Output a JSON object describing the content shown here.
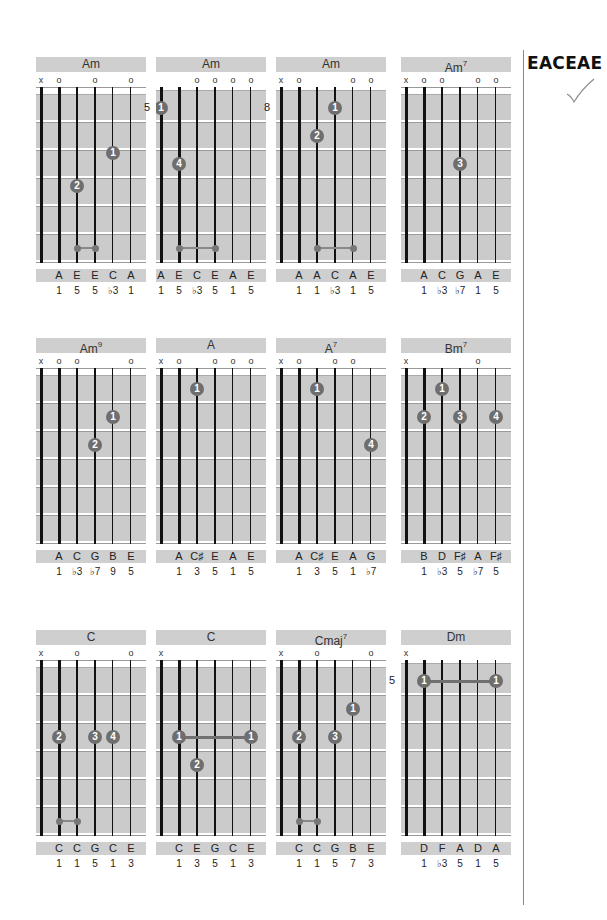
{
  "tuning": {
    "label": "EACEAE",
    "status_icon": "checkmark-icon"
  },
  "chords": [
    {
      "name": "Am",
      "sup": "",
      "marks": [
        "x",
        "o",
        "",
        "o",
        "",
        "o"
      ],
      "start_fret": "",
      "nut": true,
      "dots": [
        {
          "s": 4,
          "f": 2.1,
          "label": "1"
        },
        {
          "s": 2,
          "f": 3.3,
          "label": "2"
        }
      ],
      "barres": [],
      "small_barres": [
        {
          "from": 2,
          "to": 3,
          "f": 5.5
        }
      ],
      "notes": [
        "",
        "A",
        "E",
        "E",
        "C",
        "A"
      ],
      "degrees": [
        "",
        "1",
        "5",
        "5",
        "♭3",
        "1"
      ]
    },
    {
      "name": "Am",
      "sup": "",
      "marks": [
        "",
        "",
        "o",
        "o",
        "o",
        "o"
      ],
      "start_fret": "5",
      "nut": false,
      "dots": [
        {
          "s": 0,
          "f": 0.5,
          "label": "1"
        },
        {
          "s": 1,
          "f": 2.5,
          "label": "4"
        }
      ],
      "barres": [],
      "small_barres": [
        {
          "from": 1,
          "to": 3,
          "f": 5.5
        }
      ],
      "notes": [
        "A",
        "E",
        "C",
        "E",
        "A",
        "E"
      ],
      "degrees": [
        "1",
        "5",
        "♭3",
        "5",
        "1",
        "5"
      ]
    },
    {
      "name": "Am",
      "sup": "",
      "marks": [
        "x",
        "o",
        "",
        "",
        "o",
        "o"
      ],
      "start_fret": "8",
      "nut": false,
      "dots": [
        {
          "s": 3,
          "f": 0.5,
          "label": "1"
        },
        {
          "s": 2,
          "f": 1.5,
          "label": "2"
        }
      ],
      "barres": [],
      "small_barres": [
        {
          "from": 2,
          "to": 4,
          "f": 5.5
        }
      ],
      "notes": [
        "",
        "A",
        "A",
        "C",
        "A",
        "E"
      ],
      "degrees": [
        "",
        "1",
        "1",
        "♭3",
        "1",
        "5"
      ]
    },
    {
      "name": "Am",
      "sup": "7",
      "marks": [
        "x",
        "o",
        "o",
        "",
        "o",
        "o"
      ],
      "start_fret": "",
      "nut": true,
      "dots": [
        {
          "s": 3,
          "f": 2.5,
          "label": "3"
        }
      ],
      "barres": [],
      "small_barres": [],
      "notes": [
        "",
        "A",
        "C",
        "G",
        "A",
        "E"
      ],
      "degrees": [
        "",
        "1",
        "♭3",
        "♭7",
        "1",
        "5"
      ]
    },
    {
      "name": "Am",
      "sup": "9",
      "marks": [
        "x",
        "o",
        "o",
        "",
        "",
        "o"
      ],
      "start_fret": "",
      "nut": true,
      "dots": [
        {
          "s": 4,
          "f": 1.5,
          "label": "1"
        },
        {
          "s": 3,
          "f": 2.5,
          "label": "2"
        }
      ],
      "barres": [],
      "small_barres": [],
      "notes": [
        "",
        "A",
        "C",
        "G",
        "B",
        "E"
      ],
      "degrees": [
        "",
        "1",
        "♭3",
        "♭7",
        "9",
        "5"
      ]
    },
    {
      "name": "A",
      "sup": "",
      "marks": [
        "x",
        "o",
        "",
        "o",
        "o",
        "o"
      ],
      "start_fret": "",
      "nut": true,
      "dots": [
        {
          "s": 2,
          "f": 0.5,
          "label": "1"
        }
      ],
      "barres": [],
      "small_barres": [],
      "notes": [
        "",
        "A",
        "C♯",
        "E",
        "A",
        "E"
      ],
      "degrees": [
        "",
        "1",
        "3",
        "5",
        "1",
        "5"
      ]
    },
    {
      "name": "A",
      "sup": "7",
      "marks": [
        "x",
        "o",
        "",
        "o",
        "o",
        ""
      ],
      "start_fret": "",
      "nut": true,
      "dots": [
        {
          "s": 2,
          "f": 0.5,
          "label": "1"
        },
        {
          "s": 5,
          "f": 2.5,
          "label": "4"
        }
      ],
      "barres": [],
      "small_barres": [],
      "notes": [
        "",
        "A",
        "C♯",
        "E",
        "A",
        "G"
      ],
      "degrees": [
        "",
        "1",
        "3",
        "5",
        "1",
        "♭7"
      ]
    },
    {
      "name": "Bm",
      "sup": "7",
      "marks": [
        "x",
        "",
        "",
        "",
        "o",
        ""
      ],
      "start_fret": "",
      "nut": true,
      "dots": [
        {
          "s": 2,
          "f": 0.5,
          "label": "1"
        },
        {
          "s": 1,
          "f": 1.5,
          "label": "2"
        },
        {
          "s": 3,
          "f": 1.5,
          "label": "3"
        },
        {
          "s": 5,
          "f": 1.5,
          "label": "4"
        }
      ],
      "barres": [],
      "small_barres": [],
      "notes": [
        "",
        "B",
        "D",
        "F♯",
        "A",
        "F♯"
      ],
      "degrees": [
        "",
        "1",
        "♭3",
        "5",
        "♭7",
        "5"
      ]
    },
    {
      "name": "C",
      "sup": "",
      "marks": [
        "x",
        "",
        "o",
        "",
        "",
        "o"
      ],
      "start_fret": "",
      "nut": true,
      "dots": [
        {
          "s": 1,
          "f": 2.5,
          "label": "2"
        },
        {
          "s": 3,
          "f": 2.5,
          "label": "3"
        },
        {
          "s": 4,
          "f": 2.5,
          "label": "4"
        }
      ],
      "barres": [],
      "small_barres": [
        {
          "from": 1,
          "to": 2,
          "f": 5.5
        }
      ],
      "notes": [
        "",
        "C",
        "C",
        "G",
        "C",
        "E"
      ],
      "degrees": [
        "",
        "1",
        "1",
        "5",
        "1",
        "3"
      ]
    },
    {
      "name": "C",
      "sup": "",
      "marks": [
        "x",
        "",
        "",
        "",
        "",
        ""
      ],
      "start_fret": "",
      "nut": true,
      "dots": [
        {
          "s": 1,
          "f": 2.5,
          "label": "1"
        },
        {
          "s": 5,
          "f": 2.5,
          "label": "1"
        },
        {
          "s": 2,
          "f": 3.5,
          "label": "2"
        }
      ],
      "barres": [
        {
          "from": 1,
          "to": 5,
          "f": 2.5
        }
      ],
      "small_barres": [],
      "notes": [
        "",
        "C",
        "E",
        "G",
        "C",
        "E"
      ],
      "degrees": [
        "",
        "1",
        "3",
        "5",
        "1",
        "3"
      ]
    },
    {
      "name": "Cmaj",
      "sup": "7",
      "marks": [
        "x",
        "",
        "o",
        "",
        "",
        "o"
      ],
      "start_fret": "",
      "nut": true,
      "dots": [
        {
          "s": 4,
          "f": 1.5,
          "label": "1"
        },
        {
          "s": 1,
          "f": 2.5,
          "label": "2"
        },
        {
          "s": 3,
          "f": 2.5,
          "label": "3"
        }
      ],
      "barres": [],
      "small_barres": [
        {
          "from": 1,
          "to": 2,
          "f": 5.5
        }
      ],
      "notes": [
        "",
        "C",
        "C",
        "G",
        "B",
        "E"
      ],
      "degrees": [
        "",
        "1",
        "1",
        "5",
        "7",
        "3"
      ]
    },
    {
      "name": "Dm",
      "sup": "",
      "marks": [
        "x",
        "",
        "",
        "",
        "",
        ""
      ],
      "start_fret": "5",
      "nut": false,
      "dots": [
        {
          "s": 1,
          "f": 0.5,
          "label": "1"
        },
        {
          "s": 5,
          "f": 0.5,
          "label": "1"
        }
      ],
      "barres": [
        {
          "from": 1,
          "to": 5,
          "f": 0.5
        }
      ],
      "small_barres": [],
      "notes": [
        "",
        "D",
        "F",
        "A",
        "D",
        "A"
      ],
      "degrees": [
        "",
        "1",
        "♭3",
        "5",
        "1",
        "5"
      ]
    }
  ]
}
